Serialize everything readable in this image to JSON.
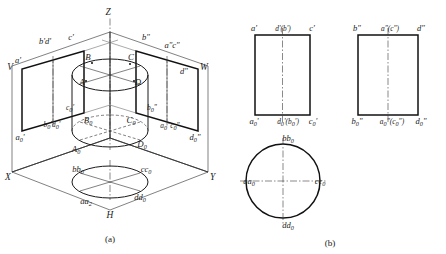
{
  "figure": {
    "panels": [
      {
        "id": "a",
        "caption": "(a)"
      },
      {
        "id": "b",
        "caption": "(b)"
      }
    ]
  },
  "panel_a": {
    "caption": "(a)",
    "axes": [
      {
        "name": "axis-z",
        "label": "Z"
      },
      {
        "name": "axis-x",
        "label": "X"
      },
      {
        "name": "axis-y",
        "label": "Y"
      },
      {
        "name": "plane-v",
        "label": "V"
      },
      {
        "name": "plane-w",
        "label": "W"
      },
      {
        "name": "plane-h",
        "label": "H"
      }
    ],
    "v_plane_labels": [
      {
        "name": "v-top-left",
        "text": "b'd'"
      },
      {
        "name": "v-top-right",
        "text": "c'"
      },
      {
        "name": "v-left-upper",
        "text": "a'"
      },
      {
        "name": "v-left-lower",
        "text": "a",
        "sub": "0",
        "prime": "'"
      },
      {
        "name": "v-mid",
        "text": "c",
        "sub": "0",
        "prime": "'"
      },
      {
        "name": "v-inner",
        "text": "b0'd0'"
      }
    ],
    "w_plane_labels": [
      {
        "name": "w-top-left",
        "text": "b\""
      },
      {
        "name": "w-top-right",
        "text": "a\"c\""
      },
      {
        "name": "w-right-upper",
        "text": "d\""
      },
      {
        "name": "w-right-lower",
        "text": "d0\""
      },
      {
        "name": "w-inner-lower",
        "text": "a0\"c0\""
      },
      {
        "name": "w-inner",
        "text": "b0\""
      }
    ],
    "cylinder_top_labels": [
      "B",
      "C",
      "A",
      "D"
    ],
    "cylinder_bottom_labels": [
      "B0",
      "C0",
      "A0",
      "D0"
    ],
    "h_plane_labels": [
      "bb0",
      "cc0",
      "aa0",
      "dd0"
    ]
  },
  "panel_b": {
    "caption": "(b)",
    "front_view": {
      "name": "front-view-v",
      "top_labels": [
        {
          "name": "front-top-left",
          "text": "a'"
        },
        {
          "name": "front-top-mid",
          "text": "d'(b')"
        },
        {
          "name": "front-top-right",
          "text": "c'"
        }
      ],
      "bottom_labels": [
        {
          "name": "front-bottom-left",
          "text": "a0'"
        },
        {
          "name": "front-bottom-mid",
          "text": "d0'(b0')"
        },
        {
          "name": "front-bottom-right",
          "text": "c0'"
        }
      ]
    },
    "side_view": {
      "name": "side-view-w",
      "top_labels": [
        {
          "name": "side-top-left",
          "text": "b\""
        },
        {
          "name": "side-top-mid",
          "text": "a\"(c\")"
        },
        {
          "name": "side-top-right",
          "text": "d\""
        }
      ],
      "bottom_labels": [
        {
          "name": "side-bottom-left",
          "text": "b0\""
        },
        {
          "name": "side-bottom-mid",
          "text": "a0\"(c0\")"
        },
        {
          "name": "side-bottom-right",
          "text": "d0\""
        }
      ]
    },
    "top_view": {
      "name": "top-view-h",
      "labels": [
        {
          "name": "top-view-north",
          "text": "bb0"
        },
        {
          "name": "top-view-west",
          "text": "aa0"
        },
        {
          "name": "top-view-east",
          "text": "cc0"
        },
        {
          "name": "top-view-south",
          "text": "dd0"
        }
      ]
    }
  },
  "colors": {
    "outline": "#111111",
    "thin": "#2b2b2b",
    "center_line": "#3a3a3a",
    "background": "#ffffff",
    "text": "#1a1a1a"
  }
}
